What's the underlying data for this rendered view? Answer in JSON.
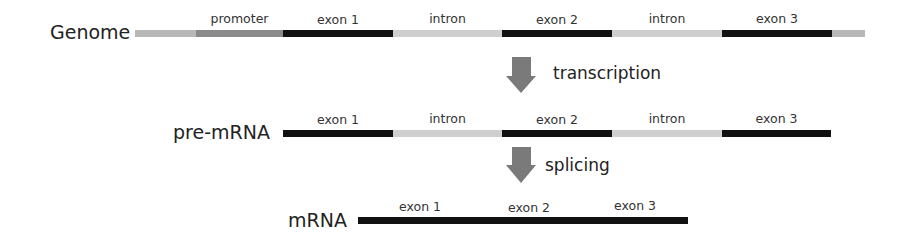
{
  "genome": {
    "label": "Genome",
    "segments": [
      {
        "type": "flank",
        "label": ""
      },
      {
        "type": "promoter",
        "label": "promoter"
      },
      {
        "type": "exon",
        "label": "exon 1"
      },
      {
        "type": "intron",
        "label": "intron"
      },
      {
        "type": "exon",
        "label": "exon 2"
      },
      {
        "type": "intron",
        "label": "intron"
      },
      {
        "type": "exon",
        "label": "exon 3"
      },
      {
        "type": "flank",
        "label": ""
      }
    ]
  },
  "step1": {
    "label": "transcription",
    "icon": "down-arrow-icon"
  },
  "pre_mrna": {
    "label": "pre-mRNA",
    "segments": [
      {
        "type": "exon",
        "label": "exon 1"
      },
      {
        "type": "intron",
        "label": "intron"
      },
      {
        "type": "exon",
        "label": "exon 2"
      },
      {
        "type": "intron",
        "label": "intron"
      },
      {
        "type": "exon",
        "label": "exon 3"
      }
    ]
  },
  "step2": {
    "label": "splicing",
    "icon": "down-arrow-icon"
  },
  "mrna": {
    "label": "mRNA",
    "segments": [
      {
        "type": "exon",
        "label": "exon 1"
      },
      {
        "type": "exon",
        "label": "exon 2"
      },
      {
        "type": "exon",
        "label": "exon 3"
      }
    ]
  },
  "colors": {
    "exon": "#111111",
    "intron": "#cfcfcf",
    "promoter": "#8a8a8a",
    "flank": "#b8b8b8",
    "arrow": "#7a7a7a"
  }
}
